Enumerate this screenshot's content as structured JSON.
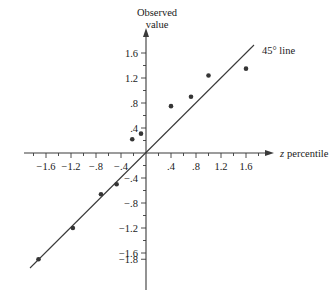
{
  "chart_data": {
    "type": "scatter",
    "title": "",
    "xlabel": "z percentile",
    "ylabel": "Observed value",
    "xlim": [
      -1.85,
      1.85
    ],
    "ylim": [
      -1.85,
      1.8
    ],
    "grid": false,
    "legend_position": "none",
    "x_tick_labels": [
      "−1.6",
      "−1.2",
      "−.8",
      "−.4",
      ".4",
      ".8",
      "1.2",
      "1.6"
    ],
    "x_tick_values": [
      -1.6,
      -1.2,
      -0.8,
      -0.4,
      0.4,
      0.8,
      1.2,
      1.6
    ],
    "x_minor_tick_values": [
      -1.8,
      -1.4,
      -1.0,
      -0.6,
      -0.2,
      0.2,
      0.6,
      1.0,
      1.4,
      1.8
    ],
    "y_tick_labels": [
      "1.6",
      "1.2",
      ".8",
      ".4",
      "−.4",
      "−.8",
      "−1.2",
      "−1.6",
      "−1.8"
    ],
    "y_tick_values": [
      1.6,
      1.2,
      0.8,
      0.4,
      -0.4,
      -0.8,
      -1.2,
      -1.6,
      -1.8
    ],
    "y_minor_tick_values": [
      1.4,
      1.0,
      0.6,
      0.2,
      -0.2,
      -0.6,
      -1.0,
      -1.4
    ],
    "series": [
      {
        "name": "Observed value vs z percentile",
        "points": [
          {
            "x": -1.72,
            "y": -1.8
          },
          {
            "x": -1.17,
            "y": -1.2
          },
          {
            "x": -0.72,
            "y": -0.66
          },
          {
            "x": -0.47,
            "y": -0.5
          },
          {
            "x": -0.22,
            "y": 0.22
          },
          {
            "x": -0.08,
            "y": 0.31
          },
          {
            "x": 0.4,
            "y": 0.75
          },
          {
            "x": 0.72,
            "y": 0.9
          },
          {
            "x": 1.0,
            "y": 1.24
          },
          {
            "x": 1.6,
            "y": 1.35
          }
        ]
      }
    ],
    "reference_line": {
      "label": "45° line",
      "slope": 1,
      "intercept": 0,
      "x_start": -1.85,
      "x_end": 1.72
    },
    "annotations": [
      {
        "text": "45° line",
        "x": 1.35,
        "y": 1.58
      }
    ]
  },
  "labels": {
    "y_axis_title_line1": "Observed",
    "y_axis_title_line2": "value",
    "x_axis_title_symbol": "z",
    "x_axis_title_rest": "percentile",
    "reference_line_label": "45° line"
  },
  "colors": {
    "axis": "#3a3a3a",
    "point": "#353535",
    "line": "#3a3a3a",
    "text": "#1a1a1a",
    "background": "#ffffff"
  }
}
